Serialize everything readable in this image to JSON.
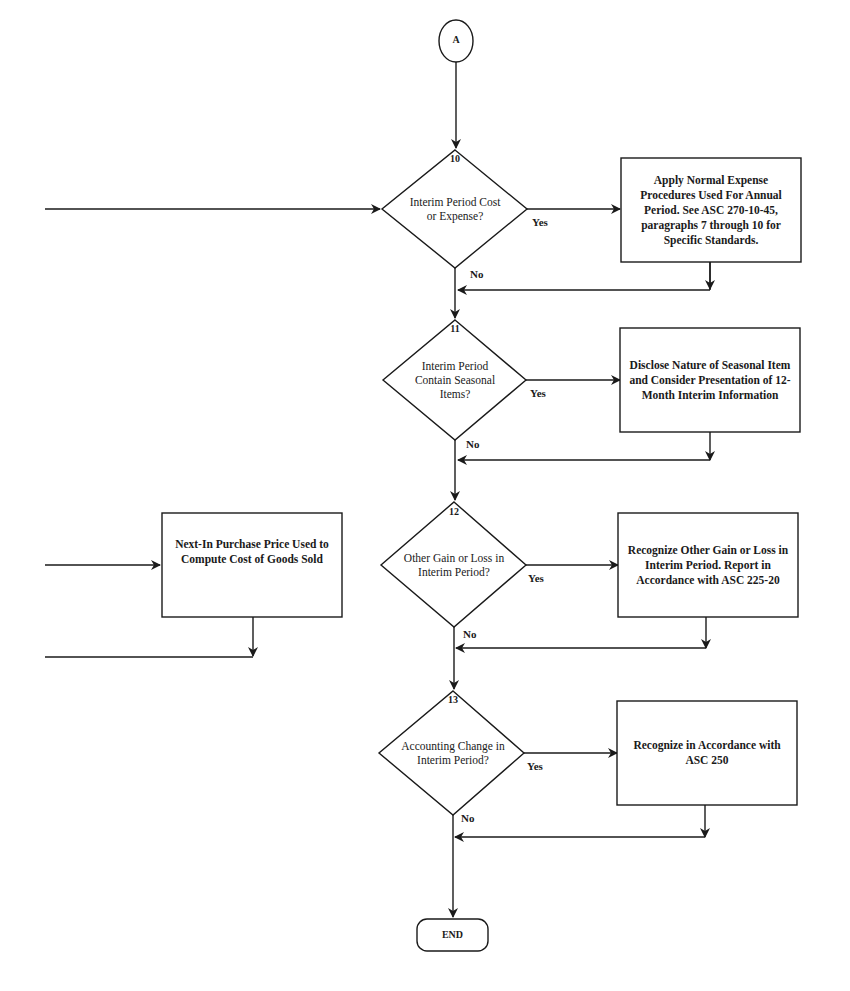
{
  "connector": {
    "label": "A"
  },
  "decisions": [
    {
      "number": "10",
      "label": "Interim Period Cost or Expense?",
      "yes": "Yes",
      "no": "No"
    },
    {
      "number": "11",
      "label": "Interim Period Contain Seasonal Items?",
      "yes": "Yes",
      "no": "No"
    },
    {
      "number": "12",
      "label": "Other Gain or Loss in Interim Period?",
      "yes": "Yes",
      "no": "No"
    },
    {
      "number": "13",
      "label": "Accounting Change in Interim Period?",
      "yes": "Yes",
      "no": "No"
    }
  ],
  "actions": [
    {
      "label": "Apply Normal Expense Procedures Used For Annual Period. See ASC 270-10-45, paragraphs 7 through 10 for Specific Standards."
    },
    {
      "label": "Disclose Nature of Seasonal Item and Consider Presentation of 12-Month Interim Information"
    },
    {
      "label": "Recognize Other Gain or Loss in Interim Period. Report in Accordance with ASC 225-20"
    },
    {
      "label": "Recognize in Accordance with ASC 250"
    }
  ],
  "side_action": {
    "label": "Next-In Purchase Price Used to Compute Cost of Goods Sold"
  },
  "terminal": {
    "label": "END"
  },
  "colors": {
    "ink": "#1a1a1a",
    "bleed": "#e4e4e4",
    "paper": "#ffffff"
  }
}
